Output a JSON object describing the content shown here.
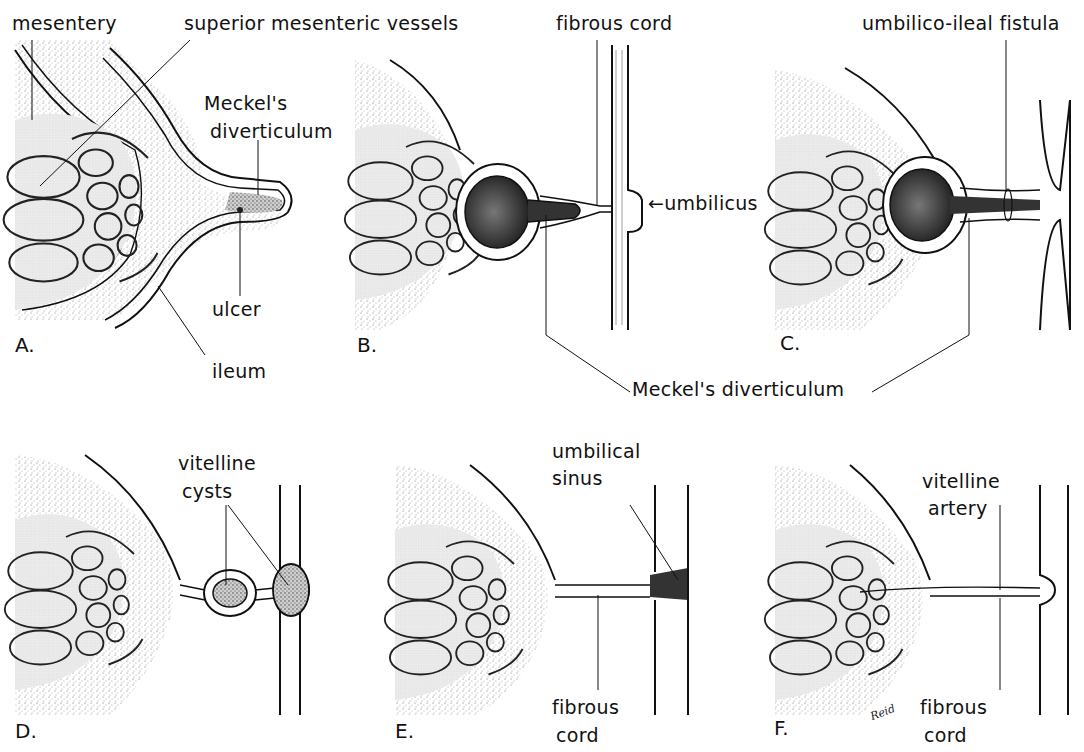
{
  "figure": {
    "signature": "Reid"
  },
  "panels": [
    {
      "id": "A",
      "letter": "A.",
      "labels": [
        "mesentery",
        "superior mesenteric vessels",
        "Meckel's diverticulum",
        "ulcer",
        "ileum"
      ]
    },
    {
      "id": "B",
      "letter": "B.",
      "labels": [
        "fibrous cord",
        "umbilicus"
      ]
    },
    {
      "id": "C",
      "letter": "C.",
      "labels": [
        "umbilico-ileal fistula"
      ]
    },
    {
      "id": "D",
      "letter": "D.",
      "labels": [
        "vitelline cysts"
      ]
    },
    {
      "id": "E",
      "letter": "E.",
      "labels": [
        "umbilical sinus",
        "fibrous cord"
      ]
    },
    {
      "id": "F",
      "letter": "F.",
      "labels": [
        "vitelline artery",
        "fibrous cord"
      ]
    }
  ],
  "labels": {
    "mesentery": "mesentery",
    "superior_mesenteric_vessels": "superior mesenteric vessels",
    "meckels_a_line1": "Meckel's",
    "meckels_a_line2": "diverticulum",
    "ulcer": "ulcer",
    "ileum": "ileum",
    "fibrous_cord_b": "fibrous cord",
    "umbilicus": "←umbilicus",
    "umbilico_ileal_fistula": "umbilico-ileal fistula",
    "meckels_shared": "Meckel's diverticulum",
    "vitelline_cysts_line1": "vitelline",
    "vitelline_cysts_line2": "cysts",
    "umbilical_sinus_line1": "umbilical",
    "umbilical_sinus_line2": "sinus",
    "fibrous_cord_e_line1": "fibrous",
    "fibrous_cord_e_line2": "cord",
    "vitelline_artery_line1": "vitelline",
    "vitelline_artery_line2": "artery",
    "fibrous_cord_f_line1": "fibrous",
    "fibrous_cord_f_line2": "cord"
  },
  "colors": {
    "ink": "#111111",
    "stipple": "#9a9a9a",
    "mesentery_fill": "#e6e6e6",
    "lumen_dark": "#3a3a3a",
    "background": "#ffffff"
  }
}
